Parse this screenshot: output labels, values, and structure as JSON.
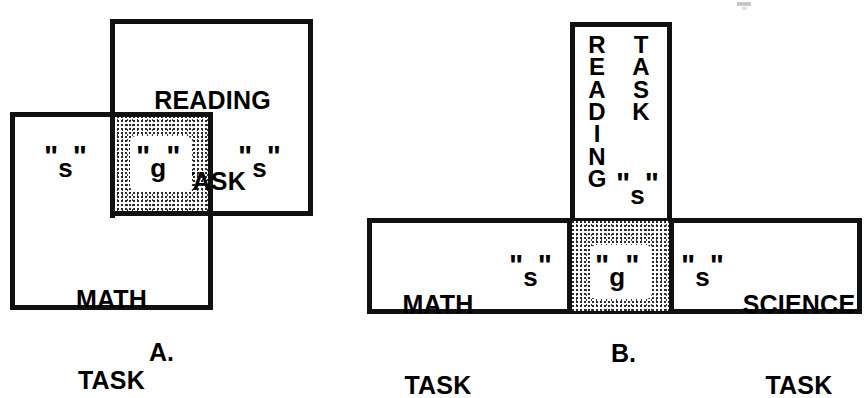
{
  "figure": {
    "background_color": "#ffffff",
    "ink_color": "#111111",
    "shade_color": "#3a3a3a"
  },
  "panel_a": {
    "letter": "A.",
    "reading_box": {
      "line1": "READING",
      "line2": "TASK"
    },
    "math_box": {
      "line1": "MATH",
      "line2": "TASK"
    },
    "markers": {
      "s_left_quote_open": "\"",
      "s_left_letter": "s",
      "s_left_quote_close": "\"",
      "g_quote_open": "\"",
      "g_letter": "g",
      "g_quote_close": "\"",
      "s_right_quote_open": "\"",
      "s_right_letter": "s",
      "s_right_quote_close": "\""
    }
  },
  "panel_b": {
    "letter": "B.",
    "reading_box": {
      "word_vertical": "R\nE\nA\nD\nI\nN\nG",
      "task_vertical": "T\nA\nS\nK",
      "s_quote_open": "\"",
      "s_letter": "s",
      "s_quote_close": "\""
    },
    "math_box": {
      "line1": "MATH",
      "line2": "TASK"
    },
    "science_box": {
      "line1": "SCIENCE",
      "line2": "TASK"
    },
    "markers": {
      "s_left_quote_open": "\"",
      "s_left_letter": "s",
      "s_left_quote_close": "\"",
      "g_quote_open": "\"",
      "g_letter": "g",
      "g_quote_close": "\"",
      "s_right_quote_open": "\"",
      "s_right_letter": "s",
      "s_right_quote_close": "\""
    }
  }
}
